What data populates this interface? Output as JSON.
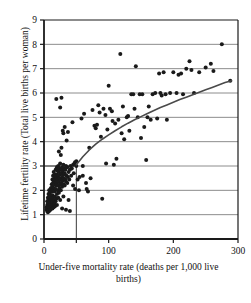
{
  "chart_data": {
    "type": "scatter",
    "title": "",
    "xlabel": "Under-five mortality rate (deaths per 1,000 live births)",
    "ylabel": "Lifetime fertility rate (Total live births per woman)",
    "xlim": [
      0,
      300
    ],
    "ylim": [
      0,
      9
    ],
    "xticks": [
      0,
      100,
      200,
      300
    ],
    "xtick_labels": [
      "0",
      "100",
      "200",
      "300"
    ],
    "yticks": [
      0,
      1,
      2,
      3,
      4,
      5,
      6,
      7,
      8,
      9
    ],
    "ytick_labels": [
      "0",
      "1",
      "2",
      "3",
      "4",
      "5",
      "6",
      "7",
      "8",
      "9"
    ],
    "grid": "horizontal",
    "grid_color": "#8c8c8c",
    "legend": "none",
    "marker_color": "#1a1a1a",
    "marker_size": 2.0,
    "trend_line": {
      "name": "smoothed fit",
      "color": "#4a4a4a",
      "width": 1.6,
      "points": [
        [
          50,
          3.05
        ],
        [
          60,
          3.38
        ],
        [
          70,
          3.66
        ],
        [
          80,
          3.9
        ],
        [
          90,
          4.1
        ],
        [
          100,
          4.28
        ],
        [
          110,
          4.45
        ],
        [
          120,
          4.61
        ],
        [
          130,
          4.76
        ],
        [
          140,
          4.9
        ],
        [
          150,
          5.03
        ],
        [
          160,
          5.16
        ],
        [
          170,
          5.28
        ],
        [
          180,
          5.4
        ],
        [
          190,
          5.51
        ],
        [
          200,
          5.62
        ],
        [
          210,
          5.73
        ],
        [
          220,
          5.83
        ],
        [
          230,
          5.93
        ],
        [
          240,
          6.03
        ],
        [
          250,
          6.13
        ],
        [
          260,
          6.23
        ],
        [
          270,
          6.33
        ],
        [
          280,
          6.43
        ],
        [
          290,
          6.5
        ]
      ]
    },
    "reference_lines": [
      {
        "orientation": "horizontal",
        "value": 3,
        "from": 0,
        "to": 50,
        "color": "#3a3a3a"
      },
      {
        "orientation": "vertical",
        "value": 50,
        "from": 0,
        "to": 3,
        "color": "#3a3a3a"
      }
    ],
    "points": [
      [
        4,
        1.2
      ],
      [
        4,
        1.3
      ],
      [
        5,
        1.15
      ],
      [
        5,
        1.4
      ],
      [
        5,
        1.55
      ],
      [
        6,
        1.1
      ],
      [
        6,
        1.25
      ],
      [
        6,
        1.45
      ],
      [
        6,
        1.7
      ],
      [
        7,
        1.2
      ],
      [
        7,
        1.35
      ],
      [
        7,
        1.6
      ],
      [
        7,
        1.85
      ],
      [
        8,
        1.15
      ],
      [
        8,
        1.3
      ],
      [
        8,
        1.5
      ],
      [
        8,
        1.75
      ],
      [
        8,
        2.0
      ],
      [
        9,
        1.25
      ],
      [
        9,
        1.45
      ],
      [
        9,
        1.65
      ],
      [
        9,
        1.9
      ],
      [
        10,
        1.2
      ],
      [
        10,
        1.4
      ],
      [
        10,
        1.6
      ],
      [
        10,
        1.8
      ],
      [
        10,
        2.05
      ],
      [
        11,
        1.3
      ],
      [
        11,
        1.55
      ],
      [
        11,
        1.75
      ],
      [
        11,
        2.1
      ],
      [
        12,
        1.35
      ],
      [
        12,
        1.6
      ],
      [
        12,
        1.95
      ],
      [
        12,
        2.25
      ],
      [
        13,
        1.25
      ],
      [
        13,
        1.5
      ],
      [
        13,
        1.8
      ],
      [
        13,
        2.15
      ],
      [
        13,
        2.45
      ],
      [
        14,
        1.4
      ],
      [
        14,
        1.7
      ],
      [
        14,
        2.0
      ],
      [
        14,
        2.3
      ],
      [
        14,
        2.6
      ],
      [
        15,
        1.3
      ],
      [
        15,
        1.6
      ],
      [
        15,
        2.1
      ],
      [
        15,
        2.4
      ],
      [
        15,
        2.75
      ],
      [
        16,
        1.45
      ],
      [
        16,
        1.95
      ],
      [
        16,
        2.25
      ],
      [
        16,
        2.55
      ],
      [
        17,
        1.35
      ],
      [
        17,
        1.75
      ],
      [
        17,
        2.35
      ],
      [
        17,
        2.65
      ],
      [
        18,
        1.55
      ],
      [
        18,
        2.05
      ],
      [
        18,
        2.45
      ],
      [
        18,
        2.85
      ],
      [
        19,
        1.65
      ],
      [
        19,
        2.2
      ],
      [
        19,
        2.55
      ],
      [
        19,
        5.75
      ],
      [
        20,
        1.4
      ],
      [
        20,
        1.85
      ],
      [
        20,
        2.3
      ],
      [
        20,
        2.65
      ],
      [
        20,
        2.95
      ],
      [
        21,
        2.0
      ],
      [
        21,
        2.45
      ],
      [
        21,
        2.8
      ],
      [
        22,
        1.7
      ],
      [
        22,
        2.2
      ],
      [
        22,
        2.6
      ],
      [
        22,
        3.0
      ],
      [
        23,
        1.9
      ],
      [
        23,
        2.35
      ],
      [
        23,
        2.75
      ],
      [
        23,
        3.6
      ],
      [
        24,
        2.1
      ],
      [
        24,
        2.5
      ],
      [
        24,
        2.9
      ],
      [
        25,
        1.6
      ],
      [
        25,
        2.25
      ],
      [
        25,
        2.65
      ],
      [
        25,
        3.1
      ],
      [
        25,
        5.4
      ],
      [
        26,
        2.0
      ],
      [
        26,
        2.45
      ],
      [
        26,
        2.85
      ],
      [
        26,
        3.45
      ],
      [
        27,
        2.3
      ],
      [
        27,
        2.7
      ],
      [
        27,
        3.75
      ],
      [
        27,
        5.8
      ],
      [
        28,
        1.25
      ],
      [
        28,
        2.15
      ],
      [
        28,
        2.55
      ],
      [
        28,
        2.95
      ],
      [
        29,
        2.4
      ],
      [
        29,
        2.8
      ],
      [
        29,
        4.45
      ],
      [
        30,
        1.75
      ],
      [
        30,
        2.25
      ],
      [
        30,
        2.65
      ],
      [
        30,
        3.05
      ],
      [
        30,
        4.35
      ],
      [
        31,
        2.5
      ],
      [
        31,
        2.9
      ],
      [
        32,
        2.2
      ],
      [
        32,
        2.7
      ],
      [
        32,
        4.6
      ],
      [
        33,
        2.45
      ],
      [
        33,
        2.85
      ],
      [
        34,
        1.2
      ],
      [
        34,
        2.35
      ],
      [
        34,
        3.0
      ],
      [
        35,
        2.6
      ],
      [
        35,
        4.05
      ],
      [
        36,
        2.3
      ],
      [
        36,
        2.95
      ],
      [
        37,
        2.55
      ],
      [
        37,
        4.4
      ],
      [
        38,
        2.75
      ],
      [
        38,
        1.6
      ],
      [
        39,
        2.45
      ],
      [
        40,
        2.85
      ],
      [
        40,
        1.15
      ],
      [
        41,
        3.0
      ],
      [
        42,
        2.6
      ],
      [
        43,
        2.9
      ],
      [
        44,
        4.8
      ],
      [
        45,
        2.2
      ],
      [
        45,
        3.05
      ],
      [
        46,
        2.7
      ],
      [
        47,
        3.1
      ],
      [
        48,
        2.05
      ],
      [
        48,
        3.15
      ],
      [
        50,
        3.0
      ],
      [
        50,
        3.2
      ],
      [
        52,
        2.45
      ],
      [
        54,
        2.0
      ],
      [
        55,
        2.55
      ],
      [
        58,
        4.95
      ],
      [
        60,
        2.6
      ],
      [
        60,
        3.0
      ],
      [
        62,
        5.15
      ],
      [
        65,
        2.3
      ],
      [
        66,
        2.05
      ],
      [
        68,
        1.95
      ],
      [
        70,
        3.75
      ],
      [
        72,
        2.5
      ],
      [
        75,
        5.3
      ],
      [
        78,
        4.65
      ],
      [
        80,
        4.55
      ],
      [
        82,
        4.7
      ],
      [
        84,
        5.5
      ],
      [
        86,
        5.2
      ],
      [
        88,
        4.2
      ],
      [
        90,
        1.65
      ],
      [
        92,
        5.35
      ],
      [
        95,
        5.1
      ],
      [
        96,
        3.1
      ],
      [
        98,
        4.5
      ],
      [
        100,
        6.3
      ],
      [
        102,
        5.35
      ],
      [
        105,
        5.25
      ],
      [
        106,
        4.85
      ],
      [
        108,
        3.05
      ],
      [
        110,
        4.75
      ],
      [
        112,
        3.3
      ],
      [
        115,
        4.9
      ],
      [
        118,
        7.6
      ],
      [
        120,
        4.35
      ],
      [
        122,
        5.45
      ],
      [
        124,
        4.1
      ],
      [
        128,
        5.0
      ],
      [
        130,
        5.05
      ],
      [
        132,
        4.45
      ],
      [
        135,
        5.95
      ],
      [
        138,
        5.95
      ],
      [
        140,
        5.35
      ],
      [
        142,
        7.1
      ],
      [
        145,
        5.0
      ],
      [
        148,
        5.95
      ],
      [
        150,
        4.15
      ],
      [
        152,
        5.95
      ],
      [
        155,
        4.6
      ],
      [
        158,
        3.25
      ],
      [
        160,
        5.0
      ],
      [
        162,
        5.45
      ],
      [
        165,
        4.9
      ],
      [
        168,
        5.95
      ],
      [
        172,
        6.0
      ],
      [
        175,
        4.95
      ],
      [
        178,
        6.8
      ],
      [
        180,
        6.0
      ],
      [
        182,
        5.9
      ],
      [
        185,
        6.85
      ],
      [
        188,
        5.95
      ],
      [
        190,
        4.9
      ],
      [
        195,
        6.0
      ],
      [
        200,
        6.85
      ],
      [
        205,
        6.0
      ],
      [
        208,
        6.75
      ],
      [
        212,
        6.8
      ],
      [
        215,
        5.95
      ],
      [
        220,
        7.0
      ],
      [
        225,
        7.3
      ],
      [
        228,
        6.95
      ],
      [
        232,
        6.0
      ],
      [
        240,
        6.85
      ],
      [
        250,
        7.05
      ],
      [
        258,
        7.2
      ],
      [
        262,
        6.9
      ],
      [
        275,
        8.0
      ],
      [
        288,
        6.5
      ]
    ]
  }
}
